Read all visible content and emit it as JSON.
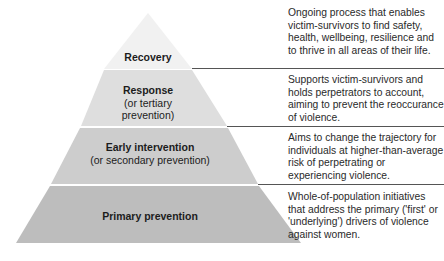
{
  "diagram": {
    "type": "pyramid",
    "tiers": [
      {
        "title": "Recovery",
        "subtitle": "",
        "description": "Ongoing process that enables victim-survivors to find safety, health, wellbeing, resilience and to thrive in all areas of their life.",
        "color": "#f1f1f1"
      },
      {
        "title": "Response",
        "subtitle": "(or tertiary prevention)",
        "subtitle_line1": "(or tertiary",
        "subtitle_line2": "prevention)",
        "description": "Supports victim-survivors and holds perpetrators to account, aiming to prevent the reoccurance of violence.",
        "color": "#dedede"
      },
      {
        "title": "Early intervention",
        "subtitle": "(or secondary prevention)",
        "description": "Aims to change the trajectory for individuals at higher-than-average risk of perpetrating or experiencing violence.",
        "color": "#cdcdcd"
      },
      {
        "title": "Primary prevention",
        "subtitle": "",
        "description": "Whole-of-population initiatives that address the primary ('first' or 'underlying') drivers of violence against women.",
        "color": "#bdbdbd"
      }
    ]
  }
}
